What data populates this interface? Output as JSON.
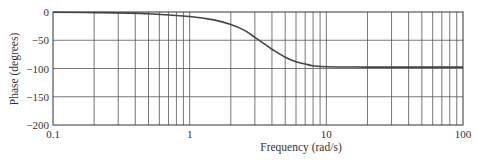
{
  "chart_data": {
    "type": "line",
    "title": "",
    "xlabel": "Frequency (rad/s)",
    "ylabel": "Phase (degrees)",
    "xscale": "log",
    "xlim": [
      0.1,
      100
    ],
    "ylim": [
      -200,
      0
    ],
    "grid": true,
    "x_ticks": [
      "0.1",
      "1",
      "10",
      "100"
    ],
    "y_ticks": [
      "0",
      "-50",
      "-100",
      "-150",
      "-200"
    ],
    "series": [
      {
        "name": "Phase",
        "x": [
          0.1,
          0.2,
          0.5,
          1,
          1.5,
          2,
          2.5,
          3,
          3.5,
          4,
          5,
          6,
          7,
          8,
          10,
          20,
          50,
          100
        ],
        "values": [
          -0.5,
          -1,
          -3,
          -8,
          -14,
          -22,
          -32,
          -45,
          -56,
          -66,
          -80,
          -88,
          -92,
          -95,
          -97,
          -97.5,
          -97.5,
          -97.5
        ]
      }
    ],
    "legend": null
  },
  "labels": {
    "xlabel": "Frequency (rad/s)",
    "ylabel": "Phase (degrees)",
    "x_ticks": [
      "0.1",
      "1",
      "10",
      "100"
    ],
    "y_ticks": [
      "0",
      "−50",
      "−100",
      "−150",
      "−200"
    ]
  }
}
